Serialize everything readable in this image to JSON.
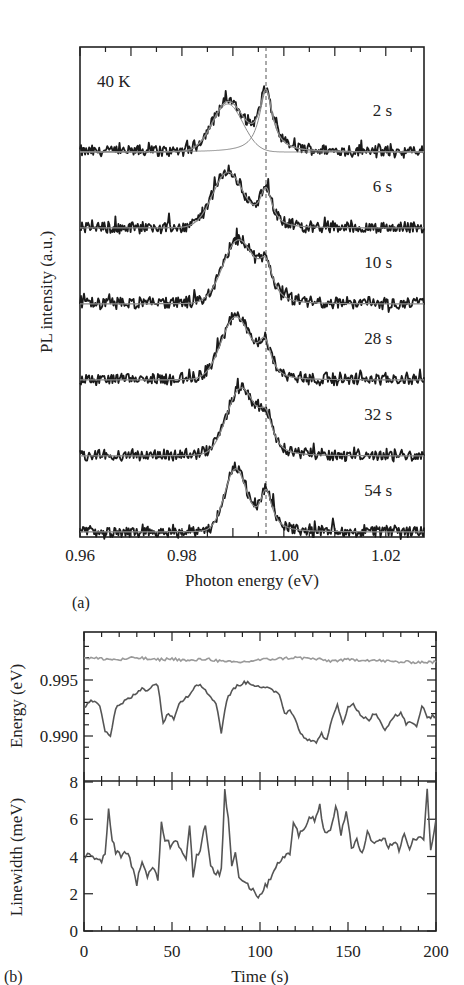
{
  "chart_data": [
    {
      "panel": "(a)",
      "type": "line",
      "title": "",
      "annotation": "40 K",
      "xlabel": "Photon energy (eV)",
      "ylabel": "PL intensity (a.u.)",
      "xlim": [
        0.96,
        1.0275
      ],
      "xticks": [
        "0.96",
        "0.98",
        "1.00",
        "1.02"
      ],
      "xtick_values": [
        0.96,
        0.98,
        1.0,
        1.02
      ],
      "vline": {
        "x": 0.9965,
        "style": "dashed"
      },
      "series": [
        {
          "name": "2 s",
          "peaks": [
            {
              "center": 0.989,
              "amp": 0.75,
              "width": 0.0035
            },
            {
              "center": 0.9965,
              "amp": 0.95,
              "width": 0.0016
            }
          ],
          "offset": 5
        },
        {
          "name": "6 s",
          "peaks": [
            {
              "center": 0.989,
              "amp": 0.85,
              "width": 0.0035
            },
            {
              "center": 0.9965,
              "amp": 0.6,
              "width": 0.0015
            }
          ],
          "offset": 4
        },
        {
          "name": "10 s",
          "peaks": [
            {
              "center": 0.991,
              "amp": 0.95,
              "width": 0.0035
            },
            {
              "center": 0.9965,
              "amp": 0.55,
              "width": 0.0018
            }
          ],
          "offset": 3
        },
        {
          "name": "28 s",
          "peaks": [
            {
              "center": 0.9905,
              "amp": 0.95,
              "width": 0.0033
            },
            {
              "center": 0.9963,
              "amp": 0.55,
              "width": 0.0016
            }
          ],
          "offset": 2
        },
        {
          "name": "32 s",
          "peaks": [
            {
              "center": 0.9915,
              "amp": 1.0,
              "width": 0.0032
            },
            {
              "center": 0.9965,
              "amp": 0.55,
              "width": 0.0018
            }
          ],
          "offset": 1
        },
        {
          "name": "54 s",
          "peaks": [
            {
              "center": 0.9905,
              "amp": 0.95,
              "width": 0.0025
            },
            {
              "center": 0.9965,
              "amp": 0.65,
              "width": 0.0015
            }
          ],
          "offset": 0
        }
      ],
      "legend": "labels beside each trace on right"
    },
    {
      "panel": "(b) top",
      "type": "line",
      "xlabel": "Time (s)",
      "ylabel": "Energy (eV)",
      "xlim": [
        0,
        200
      ],
      "ylim": [
        0.9877,
        0.9985
      ],
      "yticks": [
        "0.995",
        "0.990"
      ],
      "ytick_values": [
        0.995,
        0.99
      ],
      "series": [
        {
          "name": "high-energy peak",
          "x": [
            0,
            10,
            20,
            30,
            40,
            50,
            60,
            70,
            80,
            90,
            100,
            110,
            120,
            130,
            140,
            150,
            160,
            170,
            180,
            190,
            200
          ],
          "y": [
            0.997,
            0.9969,
            0.9968,
            0.997,
            0.9968,
            0.9969,
            0.9967,
            0.9969,
            0.9966,
            0.9966,
            0.9968,
            0.9969,
            0.997,
            0.9969,
            0.9967,
            0.9968,
            0.9968,
            0.9967,
            0.9966,
            0.9966,
            0.9966
          ]
        },
        {
          "name": "low-energy peak",
          "x": [
            0,
            3,
            6,
            9,
            12,
            15,
            18,
            21,
            24,
            27,
            30,
            33,
            36,
            39,
            42,
            45,
            48,
            51,
            54,
            57,
            60,
            63,
            66,
            69,
            72,
            75,
            78,
            81,
            84,
            87,
            90,
            93,
            96,
            99,
            102,
            105,
            108,
            111,
            114,
            117,
            120,
            123,
            126,
            129,
            132,
            135,
            138,
            141,
            144,
            147,
            150,
            153,
            156,
            159,
            162,
            165,
            168,
            171,
            174,
            177,
            180,
            183,
            186,
            189,
            192,
            195,
            198,
            200
          ],
          "y": [
            0.9925,
            0.993,
            0.9932,
            0.9928,
            0.9905,
            0.99,
            0.9925,
            0.9928,
            0.9932,
            0.9935,
            0.9938,
            0.9943,
            0.9941,
            0.9945,
            0.9946,
            0.9912,
            0.992,
            0.9916,
            0.993,
            0.9933,
            0.9937,
            0.9945,
            0.9947,
            0.994,
            0.9935,
            0.993,
            0.9903,
            0.9932,
            0.994,
            0.9945,
            0.9947,
            0.9948,
            0.9946,
            0.9945,
            0.9943,
            0.9942,
            0.994,
            0.9938,
            0.992,
            0.9923,
            0.9916,
            0.9903,
            0.9898,
            0.9895,
            0.9895,
            0.9902,
            0.9896,
            0.9915,
            0.9928,
            0.9912,
            0.9925,
            0.9928,
            0.9922,
            0.9916,
            0.9915,
            0.992,
            0.9915,
            0.9904,
            0.9912,
            0.9919,
            0.992,
            0.9911,
            0.9913,
            0.9908,
            0.9928,
            0.9915,
            0.9918,
            0.9918
          ]
        }
      ]
    },
    {
      "panel": "(b) bottom",
      "type": "line",
      "xlabel": "Time (s)",
      "ylabel": "Linewidth (meV)",
      "xlim": [
        0,
        200
      ],
      "ylim": [
        0,
        8
      ],
      "xticks": [
        "0",
        "50",
        "100",
        "150",
        "200"
      ],
      "xtick_values": [
        0,
        50,
        100,
        150,
        200
      ],
      "yticks": [
        "0",
        "2",
        "4",
        "6",
        "8"
      ],
      "ytick_values": [
        0,
        2,
        4,
        6,
        8
      ],
      "series": [
        {
          "name": "linewidth",
          "x": [
            0,
            3,
            6,
            9,
            12,
            14,
            16,
            18,
            21,
            24,
            27,
            30,
            33,
            36,
            39,
            42,
            44,
            46,
            49,
            52,
            55,
            58,
            60,
            62,
            64,
            66,
            69,
            72,
            75,
            78,
            80,
            82,
            84,
            86,
            88,
            90,
            93,
            96,
            99,
            102,
            105,
            108,
            111,
            114,
            117,
            119,
            122,
            125,
            128,
            131,
            134,
            137,
            140,
            143,
            146,
            149,
            152,
            155,
            158,
            161,
            164,
            167,
            170,
            173,
            176,
            179,
            182,
            185,
            188,
            191,
            193,
            195,
            197,
            200
          ],
          "y": [
            4.0,
            4.2,
            3.8,
            3.7,
            4.0,
            6.5,
            5.0,
            4.3,
            4.1,
            4.2,
            3.6,
            2.6,
            3.8,
            2.8,
            3.4,
            2.8,
            5.8,
            5.0,
            4.6,
            5.0,
            4.4,
            4.0,
            5.6,
            3.0,
            4.1,
            4.4,
            5.7,
            3.4,
            3.0,
            3.2,
            7.5,
            6.0,
            3.6,
            4.2,
            3.0,
            2.8,
            2.5,
            2.2,
            1.9,
            2.2,
            2.7,
            3.3,
            3.8,
            3.9,
            4.2,
            5.9,
            5.1,
            5.6,
            6.1,
            6.0,
            6.7,
            5.2,
            5.3,
            6.8,
            5.2,
            6.5,
            4.4,
            4.8,
            4.2,
            5.4,
            4.8,
            4.7,
            5.1,
            4.5,
            4.8,
            4.4,
            5.2,
            4.5,
            5.0,
            5.0,
            4.8,
            7.8,
            4.3,
            6.0
          ]
        }
      ]
    }
  ],
  "panel_a": {
    "label": "(a)",
    "temperature_label": "40 K",
    "xlabel": "Photon energy (eV)",
    "ylabel": "PL intensity (a.u.)",
    "xticks": [
      "0.96",
      "0.98",
      "1.00",
      "1.02"
    ],
    "trace_labels": [
      "2 s",
      "6 s",
      "10 s",
      "28 s",
      "32 s",
      "54 s"
    ]
  },
  "panel_b": {
    "label": "(b)",
    "xlabel": "Time (s)",
    "ylabel_top": "Energy (eV)",
    "ylabel_bottom": "Linewidth (meV)",
    "xticks": [
      "0",
      "50",
      "100",
      "150",
      "200"
    ],
    "yticks_top": [
      "0.995",
      "0.990"
    ],
    "yticks_bottom": [
      "0",
      "2",
      "4",
      "6",
      "8"
    ]
  },
  "colors": {
    "data": "#1a1a1a",
    "fit": "#8a8a8a",
    "series_b": "#555555",
    "series_b_light": "#9a9a9a",
    "axis": "#222222"
  }
}
